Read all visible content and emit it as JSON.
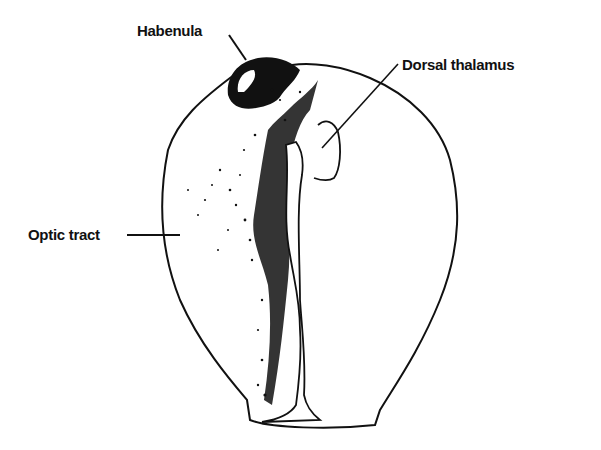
{
  "diagram": {
    "type": "anatomical line drawing",
    "labels": {
      "habenula": "Habenula",
      "dorsal_thalamus": "Dorsal thalamus",
      "optic_tract": "Optic tract"
    },
    "colors": {
      "ink": "#111111",
      "background": "#ffffff"
    }
  }
}
